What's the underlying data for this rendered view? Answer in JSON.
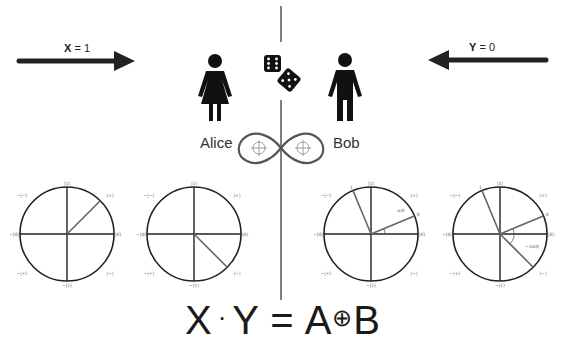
{
  "arrows": {
    "left": {
      "var": "X",
      "eq": " = 1",
      "direction": "right"
    },
    "right": {
      "var": "Y",
      "eq": " = 0",
      "direction": "left"
    }
  },
  "players": {
    "alice": "Alice",
    "bob": "Bob"
  },
  "dice_icon": "two-dice",
  "entanglement_icon": "infinity-loop",
  "equation": {
    "x": "X",
    "dot": "·",
    "y": "Y",
    "equals": " = ",
    "a": "A",
    "oplus": "⊕",
    "b": "B"
  },
  "circle_labels": {
    "top": "|1⟩",
    "bottom": "−|1⟩",
    "left": "−|0⟩",
    "right": "|0⟩",
    "top_right": "|+⟩",
    "top_left": "−|−⟩",
    "bottom_left": "−|+⟩",
    "bottom_right": "|−⟩"
  },
  "circles": [
    {
      "id": "alice-basis-1",
      "vectors_deg": [
        45
      ]
    },
    {
      "id": "alice-basis-2",
      "vectors_deg": [
        -45
      ]
    },
    {
      "id": "bob-basis-1",
      "vectors_deg": [
        112.5,
        22.5
      ],
      "vector_labels": [
        "1",
        "0"
      ],
      "angle_label": "π/8"
    },
    {
      "id": "bob-basis-2",
      "vectors_deg": [
        112.5,
        22.5,
        -45
      ],
      "vector_labels": [
        "1",
        "0"
      ],
      "angle_label": "−3π/8"
    }
  ]
}
